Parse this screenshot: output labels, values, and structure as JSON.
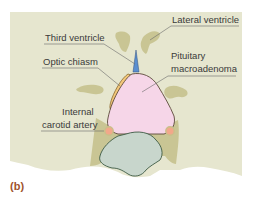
{
  "figure": {
    "panel_label": "(b)",
    "labels": {
      "lateral_ventricle": "Lateral ventricle",
      "third_ventricle": "Third ventricle",
      "optic_chiasm": "Optic chiasm",
      "pituitary_line1": "Pituitary",
      "pituitary_line2": "macroadenoma",
      "carotid_line1": "Internal",
      "carotid_line2": "carotid artery"
    },
    "colors": {
      "background_tissue": "#e6e6cf",
      "ventricle": "#c9c594",
      "tumor": "#f6d6e8",
      "optic_chiasm": "#f2c77a",
      "third_ventricle": "#5b8fd0",
      "carotid": "#f2a88a",
      "sphenoid": "#c8d6cc",
      "panel_label": "#a0522d"
    }
  }
}
